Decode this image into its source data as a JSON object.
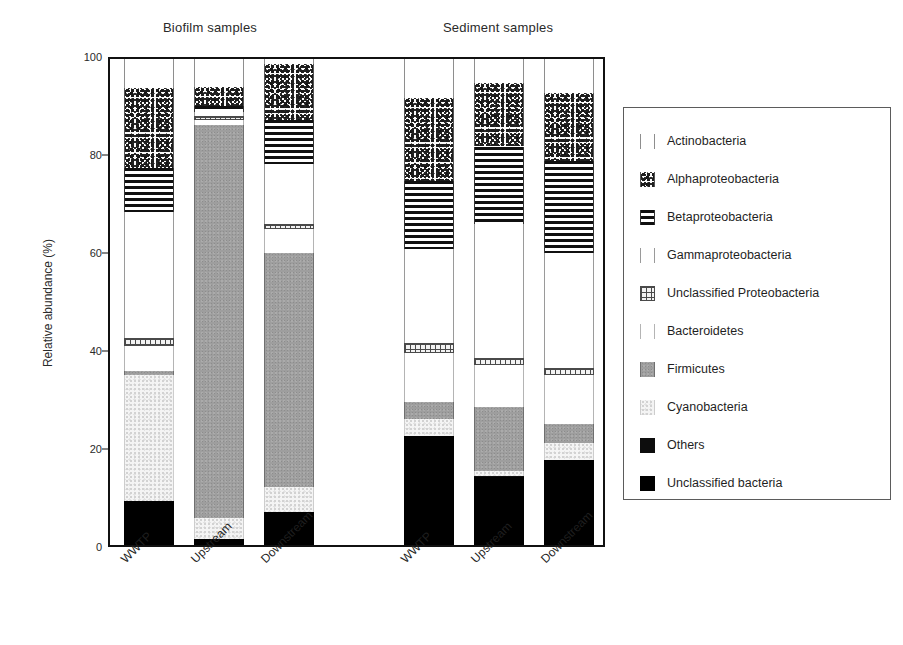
{
  "chart_data": {
    "type": "bar",
    "subtype": "stacked-bar-100percent",
    "title": "",
    "xlabel": "",
    "ylabel": "Relative abundance (%)",
    "ylim": [
      0,
      100
    ],
    "yticks": [
      0,
      20,
      40,
      60,
      80,
      100
    ],
    "grid": false,
    "legend_position": "right",
    "group_titles": [
      "Biofilm samples",
      "Sediment samples"
    ],
    "categories": [
      "WWTP",
      "Upstream",
      "Downstream",
      "WWTP",
      "Upstream",
      "Downstream"
    ],
    "groups": [
      {
        "name": "Biofilm samples",
        "categories": [
          "WWTP",
          "Upstream",
          "Downstream"
        ]
      },
      {
        "name": "Sediment samples",
        "categories": [
          "WWTP",
          "Upstream",
          "Downstream"
        ]
      }
    ],
    "series": [
      {
        "name": "Unclassified bacteria",
        "pattern": "solid-black",
        "values": [
          9.0,
          1.2,
          6.8,
          22.5,
          14.0,
          17.5
        ]
      },
      {
        "name": "Others",
        "pattern": "solid-black",
        "values": [
          0.0,
          0.0,
          0.0,
          0.0,
          0.3,
          0.0
        ]
      },
      {
        "name": "Cyanobacteria",
        "pattern": "light-speckle",
        "values": [
          26.0,
          4.3,
          5.2,
          3.5,
          1.0,
          3.5
        ]
      },
      {
        "name": "Firmicutes",
        "pattern": "solid-gray",
        "values": [
          0.9,
          81.0,
          48.0,
          3.5,
          13.0,
          4.0
        ]
      },
      {
        "name": "Bacteroidetes",
        "pattern": "white",
        "values": [
          5.1,
          1.0,
          5.0,
          10.0,
          8.7,
          10.0
        ]
      },
      {
        "name": "Unclassified Proteobacteria",
        "pattern": "cross-hatch",
        "values": [
          1.5,
          0.8,
          1.0,
          2.0,
          1.5,
          1.5
        ]
      },
      {
        "name": "Gammaproteobacteria",
        "pattern": "white",
        "values": [
          26.0,
          0.9,
          12.5,
          19.5,
          27.5,
          23.5
        ]
      },
      {
        "name": "Betaproteobacteria",
        "pattern": "horizontal-stripes",
        "values": [
          9.0,
          1.2,
          9.0,
          14.0,
          16.0,
          19.0
        ]
      },
      {
        "name": "Alphaproteobacteria",
        "pattern": "dense-speckle",
        "values": [
          16.5,
          3.8,
          11.5,
          17.0,
          13.0,
          14.0
        ]
      },
      {
        "name": "Actinobacteria",
        "pattern": "white",
        "values": [
          6.0,
          5.8,
          1.0,
          8.0,
          5.0,
          7.0
        ]
      }
    ]
  },
  "legend": {
    "items": [
      {
        "label": "Actinobacteria",
        "swatch": "white-swatch-icon"
      },
      {
        "label": "Alphaproteobacteria",
        "swatch": "dense-speckle-swatch-icon"
      },
      {
        "label": "Betaproteobacteria",
        "swatch": "horizontal-stripes-swatch-icon"
      },
      {
        "label": "Gammaproteobacteria",
        "swatch": "white-swatch-icon"
      },
      {
        "label": "Unclassified Proteobacteria",
        "swatch": "cross-hatch-swatch-icon"
      },
      {
        "label": "Bacteroidetes",
        "swatch": "white-swatch-icon"
      },
      {
        "label": "Firmicutes",
        "swatch": "solid-gray-swatch-icon"
      },
      {
        "label": "Cyanobacteria",
        "swatch": "light-speckle-swatch-icon"
      },
      {
        "label": "Others",
        "swatch": "solid-black-swatch-icon"
      },
      {
        "label": "Unclassified bacteria",
        "swatch": "solid-black-swatch-icon"
      }
    ]
  },
  "axis": {
    "y_title": "Relative abundance (%)",
    "y_ticks": [
      "100",
      "80",
      "60",
      "40",
      "20",
      "0"
    ],
    "x_ticks": [
      "WWTP",
      "Upstream",
      "Downstream",
      "WWTP",
      "Upstream",
      "Downstream"
    ]
  }
}
